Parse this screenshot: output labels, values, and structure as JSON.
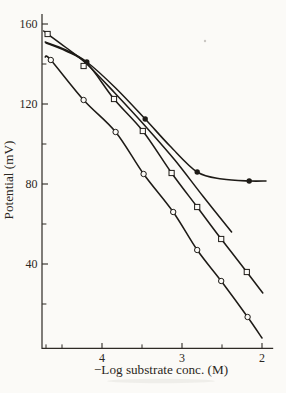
{
  "figure": {
    "paper": "#fbfaf7",
    "ink": "#1e1b17",
    "axis_color": "#2e2a25",
    "marker_fill": "#fbfaf7"
  },
  "chart_data": {
    "type": "line",
    "title": "",
    "xlabel": "−Log substrate conc. (M)",
    "ylabel": "Potential (mV)",
    "grid": false,
    "legend": "none",
    "x_axis_inverted": true,
    "x_range": [
      4.75,
      1.86
    ],
    "y_range": [
      0,
      165
    ],
    "x_ticks_major": {
      "values": [
        4,
        3,
        2
      ],
      "labels": [
        "4",
        "3",
        "2"
      ]
    },
    "x_ticks_minor": [
      4.7,
      4.5,
      3.5,
      2.5
    ],
    "y_ticks_major": {
      "values": [
        160,
        120,
        80,
        40
      ],
      "labels": [
        "160",
        "120",
        "80",
        "40"
      ]
    },
    "y_ticks_minor": [
      140,
      100,
      60,
      20
    ],
    "series": [
      {
        "name": "filled-circles-plateau-curve",
        "marker": "circle-filled",
        "x": [
          4.71,
          4.45,
          4.19,
          3.83,
          3.46,
          3.15,
          2.81,
          2.5,
          2.16,
          1.95
        ],
        "y": [
          151,
          147,
          141,
          128,
          112.5,
          99,
          86,
          82.5,
          81.5,
          81.5
        ],
        "marker_x": [
          4.19,
          3.46,
          2.81,
          2.16
        ],
        "marker_y": [
          141,
          112.5,
          86,
          81.5
        ]
      },
      {
        "name": "open-squares-upper-curve",
        "marker": "square-open",
        "x": [
          4.73,
          4.46,
          4.19,
          3.84,
          3.46,
          3.09,
          2.74,
          2.38
        ],
        "y": [
          156.5,
          148.5,
          140,
          125.5,
          109,
          92,
          74,
          56
        ],
        "marker_x": [
          4.68,
          4.23
        ],
        "marker_y": [
          155,
          139
        ]
      },
      {
        "name": "open-squares-lower-curve",
        "marker": "square-open",
        "x": [
          4.7,
          4.45,
          4.18,
          3.85,
          3.49,
          3.13,
          2.81,
          2.51,
          2.19,
          1.99
        ],
        "y": [
          150.5,
          146.5,
          140,
          122.5,
          106.5,
          85.5,
          68.5,
          52.5,
          36,
          25.5
        ],
        "marker_x": [
          3.85,
          3.49,
          3.13,
          2.81,
          2.51,
          2.19
        ],
        "marker_y": [
          122.5,
          106.5,
          85.5,
          68.5,
          52.5,
          36
        ]
      },
      {
        "name": "open-circles-steep-curve",
        "marker": "circle-open",
        "x": [
          4.71,
          4.64,
          4.23,
          3.83,
          3.48,
          3.11,
          2.81,
          2.51,
          2.18,
          2.0
        ],
        "y": [
          143.5,
          142,
          122,
          106,
          85,
          66,
          47,
          31.5,
          13.5,
          3
        ],
        "marker_x": [
          4.64,
          4.23,
          3.83,
          3.48,
          3.11,
          2.81,
          2.51,
          2.18
        ],
        "marker_y": [
          142,
          122,
          106,
          85,
          66,
          47,
          31.5,
          13.5
        ]
      }
    ]
  }
}
